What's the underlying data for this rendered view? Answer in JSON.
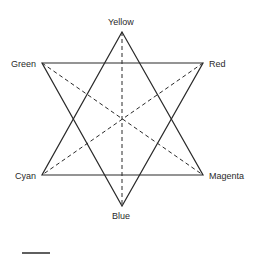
{
  "diagram": {
    "type": "color hexagram (two overlapping triangles)",
    "vertices": [
      {
        "name": "Yellow",
        "x": 122,
        "y": 32
      },
      {
        "name": "Red",
        "x": 203,
        "y": 63
      },
      {
        "name": "Magenta",
        "x": 203,
        "y": 175
      },
      {
        "name": "Blue",
        "x": 122,
        "y": 206
      },
      {
        "name": "Cyan",
        "x": 42,
        "y": 175
      },
      {
        "name": "Green",
        "x": 42,
        "y": 63
      }
    ],
    "labels": {
      "yellow": "Yellow",
      "red": "Red",
      "magenta": "Magenta",
      "blue": "Blue",
      "cyan": "Cyan",
      "green": "Green"
    },
    "solid_triangles": [
      [
        "Yellow",
        "Magenta",
        "Cyan"
      ],
      [
        "Green",
        "Red",
        "Blue"
      ]
    ],
    "dashed_diagonals": [
      [
        "Yellow",
        "Blue"
      ],
      [
        "Green",
        "Magenta"
      ],
      [
        "Red",
        "Cyan"
      ]
    ],
    "scale_bar": {
      "x1": 22,
      "x2": 50,
      "y": 253
    },
    "colors": {
      "stroke": "#2a2a2a",
      "background": "#ffffff"
    }
  }
}
